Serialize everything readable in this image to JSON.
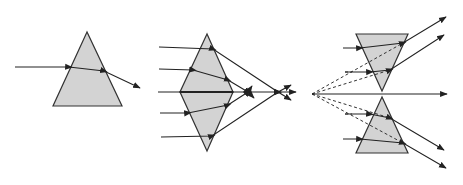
{
  "diagram": {
    "title": "",
    "colors": {
      "prism_fill": "#d3d3d3",
      "stroke": "#222222",
      "background": "#ffffff"
    },
    "panels": [
      {
        "id": "single-prism",
        "label": ""
      },
      {
        "id": "converging-prisms",
        "label": ""
      },
      {
        "id": "diverging-prisms",
        "label": ""
      }
    ]
  }
}
